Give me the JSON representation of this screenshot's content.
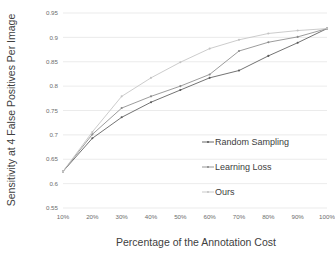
{
  "chart_data": {
    "type": "line",
    "title": "",
    "xlabel": "Percentage of the Annotation Cost",
    "ylabel": "Sensitivity at 4 False Positives Per Image",
    "x": [
      10,
      20,
      30,
      40,
      50,
      60,
      70,
      80,
      90,
      100
    ],
    "xtick_labels": [
      "10%",
      "20%",
      "30%",
      "40%",
      "50%",
      "60%",
      "70%",
      "80%",
      "90%",
      "100%"
    ],
    "ytick_labels": [
      "0.55",
      "0.6",
      "0.65",
      "0.7",
      "0.75",
      "0.8",
      "0.85",
      "0.9",
      "0.95"
    ],
    "ytick_values": [
      0.55,
      0.6,
      0.65,
      0.7,
      0.75,
      0.8,
      0.85,
      0.9,
      0.95
    ],
    "xlim": [
      10,
      100
    ],
    "ylim": [
      0.55,
      0.95
    ],
    "grid": "horizontal",
    "legend_position": "inside-right",
    "series": [
      {
        "name": "Random Sampling",
        "color": "#5a5a5a",
        "values": [
          0.625,
          0.693,
          0.736,
          0.767,
          0.792,
          0.817,
          0.832,
          0.862,
          0.889,
          0.918
        ]
      },
      {
        "name": "Learning Loss",
        "color": "#8a8a8a",
        "values": [
          0.625,
          0.701,
          0.755,
          0.779,
          0.8,
          0.824,
          0.872,
          0.89,
          0.901,
          0.918
        ]
      },
      {
        "name": "Ours",
        "color": "#c3c3c3",
        "values": [
          0.625,
          0.706,
          0.779,
          0.817,
          0.849,
          0.877,
          0.895,
          0.908,
          0.914,
          0.918
        ]
      }
    ]
  },
  "legend": {
    "items": [
      {
        "label": "Random Sampling"
      },
      {
        "label": "Learning Loss"
      },
      {
        "label": "Ours"
      }
    ]
  }
}
